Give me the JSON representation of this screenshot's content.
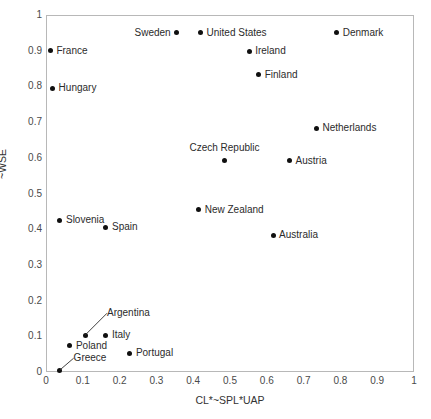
{
  "chart_data": {
    "type": "scatter",
    "title": "",
    "xlabel": "CL*~SPL*UAP",
    "ylabel": "~WSE",
    "xlim": [
      0,
      1
    ],
    "ylim": [
      0,
      1
    ],
    "grid": false,
    "legend": "none",
    "xticks": [
      "0",
      "0.1",
      "0.2",
      "0.3",
      "0.4",
      "0.5",
      "0.6",
      "0.7",
      "0.8",
      "0.9",
      "1"
    ],
    "yticks": [
      "0",
      "0.1",
      "0.2",
      "0.3",
      "0.4",
      "0.5",
      "0.6",
      "0.7",
      "0.8",
      "0.9",
      "1"
    ],
    "xtick_values": [
      0,
      0.1,
      0.2,
      0.3,
      0.4,
      0.5,
      0.6,
      0.7,
      0.8,
      0.9,
      1
    ],
    "ytick_values": [
      0,
      0.1,
      0.2,
      0.3,
      0.4,
      0.5,
      0.6,
      0.7,
      0.8,
      0.9,
      1
    ],
    "marker_color": "#101010",
    "points": [
      {
        "label": "Sweden",
        "x": 0.355,
        "y": 0.95,
        "label_pos": "left"
      },
      {
        "label": "United States",
        "x": 0.42,
        "y": 0.95,
        "label_pos": "right"
      },
      {
        "label": "Denmark",
        "x": 0.79,
        "y": 0.95,
        "label_pos": "right"
      },
      {
        "label": "France",
        "x": 0.012,
        "y": 0.9,
        "label_pos": "right"
      },
      {
        "label": "Ireland",
        "x": 0.552,
        "y": 0.898,
        "label_pos": "right"
      },
      {
        "label": "Finland",
        "x": 0.578,
        "y": 0.833,
        "label_pos": "right"
      },
      {
        "label": "Hungary",
        "x": 0.018,
        "y": 0.795,
        "label_pos": "right"
      },
      {
        "label": "Netherlands",
        "x": 0.735,
        "y": 0.683,
        "label_pos": "right"
      },
      {
        "label": "Czech Republic",
        "x": 0.485,
        "y": 0.592,
        "label_pos": "above"
      },
      {
        "label": "Austria",
        "x": 0.662,
        "y": 0.592,
        "label_pos": "right"
      },
      {
        "label": "New Zealand",
        "x": 0.415,
        "y": 0.455,
        "label_pos": "right"
      },
      {
        "label": "Slovenia",
        "x": 0.038,
        "y": 0.425,
        "label_pos": "right"
      },
      {
        "label": "Spain",
        "x": 0.163,
        "y": 0.405,
        "label_pos": "right"
      },
      {
        "label": "Australia",
        "x": 0.617,
        "y": 0.383,
        "label_pos": "right"
      },
      {
        "label": "Argentina",
        "x": 0.106,
        "y": 0.103,
        "label_pos": "leader",
        "leader_dx": 22,
        "leader_dy": -22
      },
      {
        "label": "Italy",
        "x": 0.163,
        "y": 0.103,
        "label_pos": "right"
      },
      {
        "label": "Poland",
        "x": 0.065,
        "y": 0.073,
        "label_pos": "right"
      },
      {
        "label": "Portugal",
        "x": 0.228,
        "y": 0.052,
        "label_pos": "right"
      },
      {
        "label": "Greece",
        "x": 0.037,
        "y": 0.005,
        "label_pos": "leader",
        "leader_dx": 14,
        "leader_dy": -12
      }
    ]
  }
}
